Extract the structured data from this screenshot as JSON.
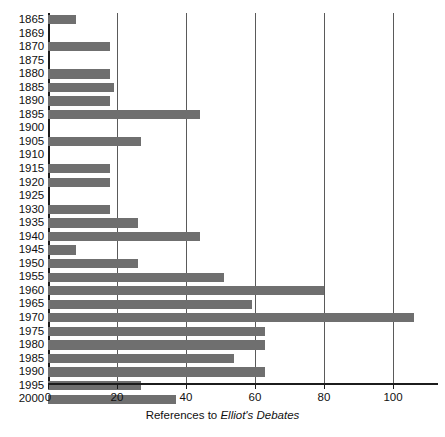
{
  "chart_data": {
    "type": "bar",
    "orientation": "horizontal",
    "title": "",
    "subtitle": "",
    "xlabel_plain": "References to ",
    "xlabel_italic": "Elliot's Debates",
    "xlabel": "References to Elliot's Debates",
    "ylabel": "",
    "xlim": [
      0,
      113
    ],
    "ylim": null,
    "grid": true,
    "grid_axis": "x",
    "legend": false,
    "legend_position": "none",
    "xticks": [
      0,
      20,
      40,
      60,
      80,
      100
    ],
    "xtick_labels": [
      "0",
      "20",
      "40",
      "60",
      "80",
      "100"
    ],
    "categories": [
      "1865",
      "1869",
      "1870",
      "1875",
      "1880",
      "1885",
      "1890",
      "1895",
      "1900",
      "1905",
      "1910",
      "1915",
      "1920",
      "1925",
      "1930",
      "1935",
      "1940",
      "1945",
      "1950",
      "1955",
      "1960",
      "1965",
      "1970",
      "1975",
      "1980",
      "1985",
      "1990",
      "1995",
      "2000"
    ],
    "values": [
      8,
      0,
      18,
      0,
      18,
      19,
      18,
      44,
      0,
      27,
      0,
      18,
      18,
      0,
      18,
      26,
      44,
      8,
      26,
      51,
      80,
      59,
      106,
      63,
      63,
      54,
      63,
      27,
      37
    ],
    "series": [
      {
        "name": "References to Elliot's Debates",
        "values": [
          8,
          0,
          18,
          0,
          18,
          19,
          18,
          44,
          0,
          27,
          0,
          18,
          18,
          0,
          18,
          26,
          44,
          8,
          26,
          51,
          80,
          59,
          106,
          63,
          63,
          54,
          63,
          27,
          37
        ]
      }
    ],
    "bar_color": "#6f6f6f",
    "axis_color": "#1c1c1c",
    "grid_color": "#5a5a5a",
    "background_color": "#ffffff"
  }
}
